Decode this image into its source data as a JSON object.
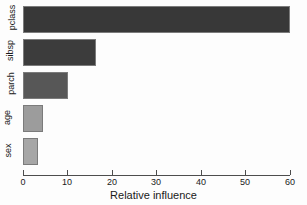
{
  "chart_data": {
    "type": "bar",
    "orientation": "horizontal",
    "title": "",
    "xlabel": "Relative influence",
    "ylabel": "",
    "categories": [
      "sex",
      "age",
      "parch",
      "sibsp",
      "pclass"
    ],
    "values": [
      3.3,
      4.5,
      10.0,
      16.5,
      60.0
    ],
    "series": [
      {
        "name": "Relative influence",
        "values": [
          3.3,
          4.5,
          10.0,
          16.5,
          60.0
        ]
      }
    ],
    "xlim": [
      0,
      60
    ],
    "xticks": [
      0,
      10,
      20,
      30,
      40,
      50,
      60
    ],
    "xticklabels": [
      "0",
      "10",
      "20",
      "30",
      "40",
      "50",
      "60"
    ],
    "grid": false,
    "legend": false,
    "bar_colors": [
      "#a6a6a6",
      "#9c9c9c",
      "#575757",
      "#3c3c3c",
      "#383838"
    ],
    "bar_border_color": "#7b7b7b",
    "background": "#fdfdfd",
    "axis_color": "#4d4d4d",
    "bars": [
      {
        "category": "pclass",
        "value": 60.0,
        "color": "#383838"
      },
      {
        "category": "sibsp",
        "value": 16.5,
        "color": "#3c3c3c"
      },
      {
        "category": "parch",
        "value": 10.0,
        "color": "#575757"
      },
      {
        "category": "age",
        "value": 4.5,
        "color": "#9c9c9c"
      },
      {
        "category": "sex",
        "value": 3.3,
        "color": "#a6a6a6"
      }
    ]
  }
}
